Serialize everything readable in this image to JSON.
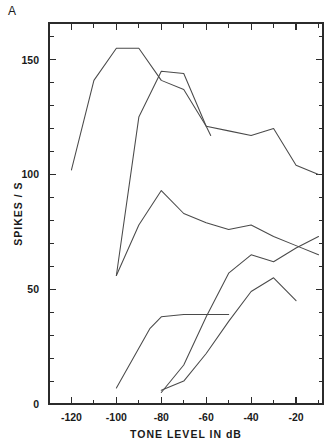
{
  "panel": {
    "label": "A"
  },
  "chart_data": {
    "type": "line",
    "title": "",
    "subtitle": "",
    "xlabel": "TONE LEVEL IN dB",
    "ylabel": "SPIKES / S",
    "xlim": [
      -130,
      -8
    ],
    "ylim": [
      0,
      166
    ],
    "grid": false,
    "legend": "none",
    "x_ticks_major": [
      -120,
      -100,
      -80,
      -60,
      -40,
      -20
    ],
    "x_tick_labels": [
      "-120",
      "-100",
      "-80",
      "-60",
      "-40",
      "-20"
    ],
    "x_tick_minor_step": 10,
    "y_ticks_major": [
      0,
      50,
      100,
      150
    ],
    "y_tick_labels": [
      "0",
      "50",
      "100",
      "150"
    ],
    "y_tick_minor_step": 10,
    "series": [
      {
        "name": "unit-1",
        "x": [
          -120,
          -110,
          -100,
          -95,
          -90,
          -80,
          -70,
          -60,
          -58
        ],
        "y": [
          102,
          141,
          155,
          155,
          155,
          141,
          137,
          121,
          117
        ]
      },
      {
        "name": "unit-2",
        "x": [
          -100,
          -90,
          -80,
          -70,
          -60,
          -50,
          -40,
          -30,
          -20,
          -10
        ],
        "y": [
          56,
          125,
          145,
          144,
          121,
          119,
          117,
          120,
          104,
          100
        ]
      },
      {
        "name": "unit-3",
        "x": [
          -100,
          -90,
          -80,
          -70,
          -60,
          -50,
          -40,
          -30,
          -20,
          -10
        ],
        "y": [
          56,
          78,
          93,
          83,
          79,
          76,
          78,
          73,
          69,
          65
        ]
      },
      {
        "name": "unit-4",
        "x": [
          -100,
          -85,
          -80,
          -70,
          -60,
          -50
        ],
        "y": [
          7,
          33,
          38,
          39,
          39,
          39
        ]
      },
      {
        "name": "unit-5",
        "x": [
          -80,
          -70,
          -60,
          -50,
          -40,
          -30,
          -20,
          -10
        ],
        "y": [
          5,
          17,
          38,
          57,
          65,
          62,
          68,
          73
        ]
      },
      {
        "name": "unit-6",
        "x": [
          -80,
          -70,
          -60,
          -50,
          -40,
          -30,
          -20
        ],
        "y": [
          6,
          10,
          22,
          36,
          49,
          55,
          45
        ]
      }
    ]
  }
}
